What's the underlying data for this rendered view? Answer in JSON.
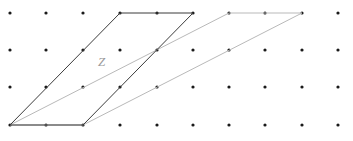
{
  "figure": {
    "width": 353,
    "height": 141,
    "background_color": "#ffffff",
    "caption_label": "Z",
    "label_color": "#9a9a9a",
    "dark_stroke_color": "#3b3b3b",
    "light_stroke_color": "#b9b9b9",
    "dot_color": "#1a1a1a"
  },
  "label": {
    "z": "Z",
    "x": 98,
    "y": 55
  },
  "lattice": {
    "dot_radius": 1.6,
    "columns": 10,
    "rows": 4,
    "origin_x": 10,
    "origin_y": 13,
    "step_x": 36.4,
    "step_y": 37.3,
    "points": [
      [
        10,
        13
      ],
      [
        46,
        13
      ],
      [
        83,
        13
      ],
      [
        120,
        13
      ],
      [
        157,
        13
      ],
      [
        193,
        13
      ],
      [
        229,
        13
      ],
      [
        265,
        13
      ],
      [
        302,
        13
      ],
      [
        338,
        13
      ],
      [
        10,
        50
      ],
      [
        46,
        50
      ],
      [
        83,
        50
      ],
      [
        120,
        50
      ],
      [
        157,
        50
      ],
      [
        193,
        50
      ],
      [
        229,
        50
      ],
      [
        265,
        50
      ],
      [
        302,
        50
      ],
      [
        338,
        50
      ],
      [
        10,
        87
      ],
      [
        46,
        87
      ],
      [
        83,
        87
      ],
      [
        120,
        87
      ],
      [
        157,
        87
      ],
      [
        193,
        87
      ],
      [
        229,
        87
      ],
      [
        265,
        87
      ],
      [
        302,
        87
      ],
      [
        338,
        87
      ],
      [
        10,
        125
      ],
      [
        46,
        125
      ],
      [
        83,
        125
      ],
      [
        120,
        125
      ],
      [
        157,
        125
      ],
      [
        193,
        125
      ],
      [
        229,
        125
      ],
      [
        265,
        125
      ],
      [
        302,
        125
      ],
      [
        338,
        125
      ]
    ]
  },
  "shapes": {
    "dark_parallelogram": {
      "name": "fundamental-domain",
      "points": "10,125 83,125 193,13 120,13",
      "stroke": "#3b3b3b"
    },
    "light_parallelogram": {
      "name": "sheared-lattice-cell",
      "points": "10,125 83,125 302,13 229,13",
      "stroke": "#b9b9b9"
    }
  }
}
